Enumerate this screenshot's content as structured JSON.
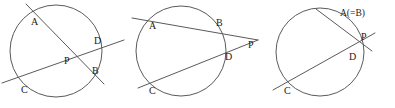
{
  "figure": {
    "width": 395,
    "height": 108,
    "background_color": "#ffffff",
    "stroke_color": "#5a5a5a",
    "label_color": "#1a1a1a"
  },
  "diagrams": [
    {
      "id": "intersecting-chords",
      "caption_case": "P inside the circle: two chords AB and CD intersect at P",
      "circle": {
        "cx": 56,
        "cy": 51,
        "r": 46
      },
      "lines": [
        {
          "name": "chord-ab",
          "x1": 26,
          "y1": 4,
          "x2": 104,
          "y2": 84
        },
        {
          "name": "chord-cd",
          "x1": 2,
          "y1": 83,
          "x2": 124,
          "y2": 40
        }
      ],
      "labels": [
        {
          "name": "point-a",
          "text": "A",
          "x": 31,
          "y": 23
        },
        {
          "name": "point-d",
          "text": "D",
          "x": 94,
          "y": 42
        },
        {
          "name": "point-p",
          "text": "P",
          "x": 64,
          "y": 62
        },
        {
          "name": "point-b",
          "text": "B",
          "x": 92,
          "y": 72
        },
        {
          "name": "point-c",
          "text": "C",
          "x": 21,
          "y": 91
        }
      ]
    },
    {
      "id": "two-secants",
      "caption_case": "P outside the circle: two secants PBA and PDC meet at P",
      "circle": {
        "cx": 181,
        "cy": 51,
        "r": 45
      },
      "lines": [
        {
          "name": "secant-ab-p",
          "x1": 132,
          "y1": 18,
          "x2": 258,
          "y2": 40
        },
        {
          "name": "secant-cd-p",
          "x1": 138,
          "y1": 88,
          "x2": 258,
          "y2": 40
        }
      ],
      "labels": [
        {
          "name": "point-a",
          "text": "A",
          "x": 149,
          "y": 27
        },
        {
          "name": "point-b",
          "text": "B",
          "x": 216,
          "y": 24
        },
        {
          "name": "point-p",
          "text": "P",
          "x": 248,
          "y": 46
        },
        {
          "name": "point-d",
          "text": "D",
          "x": 225,
          "y": 58
        },
        {
          "name": "point-c",
          "text": "C",
          "x": 149,
          "y": 92
        }
      ]
    },
    {
      "id": "tangent-and-secant",
      "caption_case": "P outside the circle: tangent at A (= B) and secant PDC meet at P",
      "circle": {
        "cx": 320,
        "cy": 52,
        "r": 44
      },
      "lines": [
        {
          "name": "tangent-at-a",
          "x1": 316,
          "y1": 9,
          "x2": 372,
          "y2": 51
        },
        {
          "name": "secant-cd-p",
          "x1": 273,
          "y1": 90,
          "x2": 375,
          "y2": 33
        }
      ],
      "labels": [
        {
          "name": "point-a-equals-b",
          "text": "A(=B)",
          "x": 340,
          "y": 14
        },
        {
          "name": "point-p",
          "text": "P",
          "x": 361,
          "y": 38
        },
        {
          "name": "point-d",
          "text": "D",
          "x": 349,
          "y": 58
        },
        {
          "name": "point-c",
          "text": "C",
          "x": 284,
          "y": 92
        }
      ]
    }
  ]
}
